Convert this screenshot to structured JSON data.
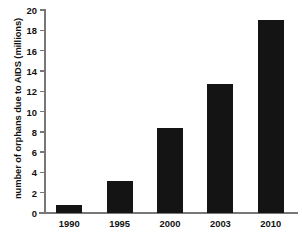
{
  "chart_data": {
    "type": "bar",
    "title": "",
    "xlabel": "",
    "ylabel": "number of orphans due to AIDS (millions)",
    "categories": [
      "1990",
      "1995",
      "2000",
      "2003",
      "2010"
    ],
    "values": [
      0.8,
      3.2,
      8.4,
      12.7,
      19.0
    ],
    "ylim": [
      0,
      20
    ],
    "ytick_labels": [
      "0",
      "2",
      "4",
      "6",
      "8",
      "10",
      "12",
      "14",
      "16",
      "18",
      "20"
    ],
    "ytick_values": [
      0,
      2,
      4,
      6,
      8,
      10,
      12,
      14,
      16,
      18,
      20
    ],
    "grid": false,
    "legend": null,
    "bar_color": "#141414",
    "axis_color": "#777777",
    "background_color": "#ffffff"
  }
}
